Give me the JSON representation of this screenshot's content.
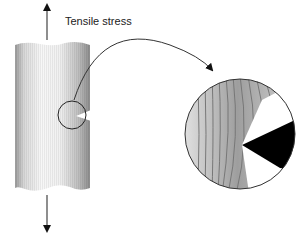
{
  "diagram": {
    "label": "Tensile stress",
    "colors": {
      "line": "#333333",
      "notch": "#000000",
      "shade_dark": "#8a8a8a",
      "shade_light": "#f2f2f2"
    }
  }
}
